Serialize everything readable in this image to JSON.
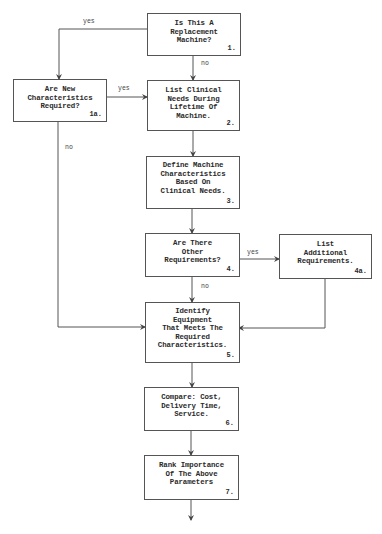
{
  "diagram": {
    "type": "flowchart",
    "nodes": [
      {
        "id": "1",
        "text": "Is This A\nReplacement\nMachine?",
        "number": "1."
      },
      {
        "id": "1a",
        "text": "Are New\nCharacteristics\nRequired?",
        "number": "1a."
      },
      {
        "id": "2",
        "text": "List Clinical\nNeeds During\nLifetime Of\nMachine.",
        "number": "2."
      },
      {
        "id": "3",
        "text": "Define Machine\nCharacteristics\nBased On\nClinical Needs.",
        "number": "3."
      },
      {
        "id": "4",
        "text": "Are There\nOther\nRequirements?",
        "number": "4."
      },
      {
        "id": "4a",
        "text": "List\nAdditional\nRequirements.",
        "number": "4a."
      },
      {
        "id": "5",
        "text": "Identify\nEquipment\nThat Meets The\nRequired\nCharacteristics.",
        "number": "5."
      },
      {
        "id": "6",
        "text": "Compare: Cost,\nDelivery Time,\nService.",
        "number": "6."
      },
      {
        "id": "7",
        "text": "Rank Importance\nOf The Above\nParameters",
        "number": "7."
      }
    ],
    "edges": [
      {
        "from": "1",
        "to": "1a",
        "label": "yes"
      },
      {
        "from": "1",
        "to": "2",
        "label": "no"
      },
      {
        "from": "1a",
        "to": "2",
        "label": "yes"
      },
      {
        "from": "1a",
        "to": "5",
        "label": "no"
      },
      {
        "from": "2",
        "to": "3",
        "label": ""
      },
      {
        "from": "3",
        "to": "4",
        "label": ""
      },
      {
        "from": "4",
        "to": "4a",
        "label": "yes"
      },
      {
        "from": "4",
        "to": "5",
        "label": "no"
      },
      {
        "from": "4a",
        "to": "5",
        "label": ""
      },
      {
        "from": "5",
        "to": "6",
        "label": ""
      },
      {
        "from": "6",
        "to": "7",
        "label": ""
      },
      {
        "from": "7",
        "to": "continue",
        "label": ""
      }
    ],
    "labels": {
      "yes_1_1a": "yes",
      "no_1_2": "no",
      "yes_1a_2": "yes",
      "no_1a_5": "no",
      "yes_4_4a": "yes",
      "no_4_5": "no"
    },
    "colors": {
      "line": "#555555",
      "text": "#2a2a2a",
      "background": "#ffffff"
    }
  }
}
